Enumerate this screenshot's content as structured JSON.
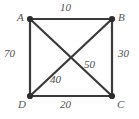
{
  "figure": {
    "type": "weighted-graph-square",
    "background_color": "#ffffff",
    "line_color": "#3a3a3a",
    "text_color": "#4a4a4a",
    "vertices": [
      {
        "id": "A",
        "label": "A",
        "x": 30,
        "y": 19,
        "corner": "top-left"
      },
      {
        "id": "B",
        "label": "B",
        "x": 112,
        "y": 19,
        "corner": "top-right"
      },
      {
        "id": "C",
        "label": "C",
        "x": 112,
        "y": 96,
        "corner": "bottom-right"
      },
      {
        "id": "D",
        "label": "D",
        "x": 30,
        "y": 96,
        "corner": "bottom-left"
      }
    ],
    "edges": [
      {
        "id": "AB",
        "from": "A",
        "to": "B",
        "weight": "10",
        "kind": "side"
      },
      {
        "id": "BC",
        "from": "B",
        "to": "C",
        "weight": "30",
        "kind": "side"
      },
      {
        "id": "DC",
        "from": "D",
        "to": "C",
        "weight": "20",
        "kind": "side"
      },
      {
        "id": "AD",
        "from": "A",
        "to": "D",
        "weight": "70",
        "kind": "side"
      },
      {
        "id": "DB",
        "from": "D",
        "to": "B",
        "weight": "40",
        "kind": "diagonal"
      },
      {
        "id": "AC",
        "from": "A",
        "to": "C",
        "weight": "50",
        "kind": "diagonal"
      }
    ]
  }
}
